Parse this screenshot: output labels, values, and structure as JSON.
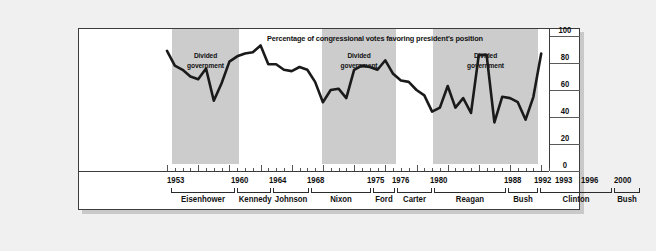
{
  "chart_data": {
    "type": "line",
    "title": "Percentage of congressional votes favoring president's position",
    "xlabel": "",
    "ylabel": "",
    "ylim": [
      0,
      100
    ],
    "yticks": [
      0,
      20,
      40,
      60,
      80,
      100
    ],
    "ytick_labels": [
      "0",
      "20",
      "40",
      "60",
      "80",
      "100"
    ],
    "grid": false,
    "legend": "none",
    "xlim": [
      1953,
      2002
    ],
    "x": [
      1953,
      1954,
      1955,
      1956,
      1957,
      1958,
      1959,
      1960,
      1961,
      1962,
      1963,
      1964,
      1965,
      1966,
      1967,
      1968,
      1969,
      1970,
      1971,
      1972,
      1973,
      1974,
      1975,
      1976,
      1977,
      1978,
      1979,
      1980,
      1981,
      1982,
      1983,
      1984,
      1985,
      1986,
      1987,
      1988,
      1989,
      1990,
      1991,
      1992,
      1993,
      1994,
      1995,
      1996,
      1997,
      1998,
      1999,
      2000,
      2001
    ],
    "values": [
      89,
      78,
      75,
      70,
      68,
      76,
      52,
      65,
      81,
      85,
      87,
      88,
      93,
      79,
      79,
      75,
      74,
      77,
      75,
      66,
      51,
      60,
      61,
      54,
      75,
      78,
      77,
      75,
      82,
      72,
      67,
      66,
      60,
      56,
      44,
      47,
      63,
      47,
      54,
      43,
      86,
      86,
      36,
      55,
      54,
      51,
      38,
      55,
      87
    ],
    "series": [
      {
        "name": "Percentage of congressional votes favoring president's position",
        "values": [
          89,
          78,
          75,
          70,
          68,
          76,
          52,
          65,
          81,
          85,
          87,
          88,
          93,
          79,
          79,
          75,
          74,
          77,
          75,
          66,
          51,
          60,
          61,
          54,
          75,
          78,
          77,
          75,
          82,
          72,
          67,
          66,
          60,
          56,
          44,
          47,
          63,
          47,
          54,
          43,
          86,
          86,
          36,
          55,
          54,
          51,
          38,
          55,
          87
        ]
      }
    ],
    "bands": [
      {
        "label_line1": "Divided",
        "label_line2": "government",
        "start": 1955,
        "end": 1961,
        "left_px": 93,
        "width_px": 67
      },
      {
        "label_line1": "Divided",
        "label_line2": "government",
        "start": 1969,
        "end": 1977,
        "left_px": 243,
        "width_px": 74
      },
      {
        "label_line1": "Divided",
        "label_line2": "government",
        "start": 1981,
        "end": 1993,
        "left_px": 354,
        "width_px": 105
      },
      {
        "label_line1": "Divided",
        "label_line2": "government",
        "start": 1995,
        "end": 2001,
        "left_px": 473,
        "width_px": 75
      }
    ],
    "year_labels": [
      {
        "text": "1953",
        "left_px": 88
      },
      {
        "text": "1960",
        "left_px": 152
      },
      {
        "text": "1964",
        "left_px": 190
      },
      {
        "text": "1968",
        "left_px": 228
      },
      {
        "text": "1975",
        "left_px": 288
      },
      {
        "text": "1976",
        "left_px": 313
      },
      {
        "text": "1980",
        "left_px": 351
      },
      {
        "text": "1988",
        "left_px": 425
      },
      {
        "text": "1992",
        "left_px": 455
      },
      {
        "text": "1993",
        "left_px": 476
      },
      {
        "text": "1996",
        "left_px": 502
      },
      {
        "text": "2000",
        "left_px": 535
      }
    ],
    "presidents": [
      {
        "name": "Eisenhower",
        "left_px": 92,
        "width_px": 64
      },
      {
        "name": "Kennedy",
        "left_px": 158,
        "width_px": 34
      },
      {
        "name": "Johnson",
        "left_px": 194,
        "width_px": 36
      },
      {
        "name": "Nixon",
        "left_px": 232,
        "width_px": 60
      },
      {
        "name": "Ford",
        "left_px": 294,
        "width_px": 22
      },
      {
        "name": "Carter",
        "left_px": 318,
        "width_px": 35
      },
      {
        "name": "Reagan",
        "left_px": 355,
        "width_px": 72
      },
      {
        "name": "Bush",
        "left_px": 429,
        "width_px": 30
      },
      {
        "name": "Clinton",
        "left_px": 461,
        "width_px": 72
      },
      {
        "name": "Bush",
        "left_px": 535,
        "width_px": 26
      }
    ],
    "colors": {
      "band_fill": "#cccccc",
      "line": "#1a1a1a",
      "frame": "#3c3c3c",
      "page_background": "#f0f0f0",
      "plot_background": "#ffffff",
      "text": "#111111"
    }
  }
}
